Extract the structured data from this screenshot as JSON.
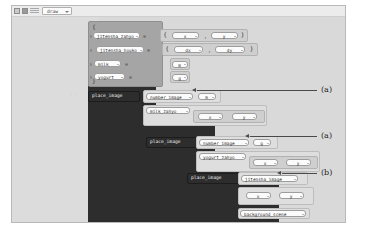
{
  "window": {
    "title": "draw",
    "toolbar_icons": [
      "grid-icon",
      "stop-icon",
      "lines-icon"
    ],
    "dropdown_caret": "chevron-down-icon"
  },
  "blocks": {
    "brace_open": "{",
    "brace_close": "}",
    "paren_open": "(",
    "paren_close": ")",
    "comma": ",",
    "equals": "=",
    "bindings": [
      {
        "name": "jitensha_zahyo",
        "value_kind": "pair",
        "values": [
          "x",
          "y"
        ]
      },
      {
        "name": "jitensha_houko",
        "value_kind": "pair",
        "values": [
          "dx",
          "dy"
        ]
      },
      {
        "name": "milk",
        "value_kind": "single",
        "values": [
          "m"
        ]
      },
      {
        "name": "yogurt",
        "value_kind": "single",
        "values": [
          "g"
        ]
      }
    ],
    "calls": [
      {
        "fn": "place_image",
        "arg_image": "number_image",
        "arg_image_param": "m",
        "arg_pos": "milk_zahyo",
        "arg_pos_params": [
          "x",
          "y"
        ],
        "annotation": "(a)"
      },
      {
        "fn": "place_image",
        "arg_image": "number_image",
        "arg_image_param": "g",
        "arg_pos": "yogurt_zahyo",
        "arg_pos_params": [
          "x",
          "y"
        ],
        "annotation": "(a)"
      },
      {
        "fn": "place_image",
        "arg_image": "jitensha_image",
        "arg_image_param": "",
        "arg_pos": "",
        "arg_pos_params": [
          "x",
          "y"
        ],
        "annotation": "(b)"
      }
    ],
    "background": "background_scene"
  },
  "annotations": [
    {
      "label": "(a)"
    },
    {
      "label": "(a)"
    },
    {
      "label": "(b)"
    }
  ],
  "colors": {
    "canvas": "#ffffff",
    "editor_bg": "#d9d9d9",
    "left_panel": "#dcdcdc",
    "dark_block": "#2d2d2d",
    "gray_block": "#a5a5a5",
    "light_block": "#cfcfcf",
    "pill_bg": "#fbfbfb",
    "annotation": "#4a4a4a"
  }
}
